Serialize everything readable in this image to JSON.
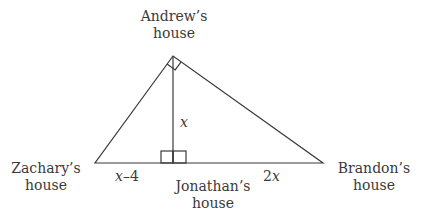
{
  "diagram": {
    "type": "right-triangle-with-altitude",
    "points": {
      "andrew": {
        "x": 173,
        "y": 56,
        "label_line1": "Andrew’s",
        "label_line2": "house"
      },
      "zachary": {
        "x": 95,
        "y": 163,
        "label_line1": "Zachary’s",
        "label_line2": "house"
      },
      "brandon": {
        "x": 323,
        "y": 163,
        "label_line1": "Brandon’s",
        "label_line2": "house"
      },
      "jonathan": {
        "x": 173,
        "y": 163,
        "label_line1": "Jonathan’s",
        "label_line2": "house"
      }
    },
    "segments": {
      "altitude_label": "x",
      "left_base_label_var": "x",
      "left_base_label_rest": "–4",
      "right_base_label_coef": "2",
      "right_base_label_var": "x"
    },
    "right_angles": [
      "at Andrew’s house",
      "at Jonathan’s house"
    ],
    "stroke_color": "#3a3a3a"
  }
}
